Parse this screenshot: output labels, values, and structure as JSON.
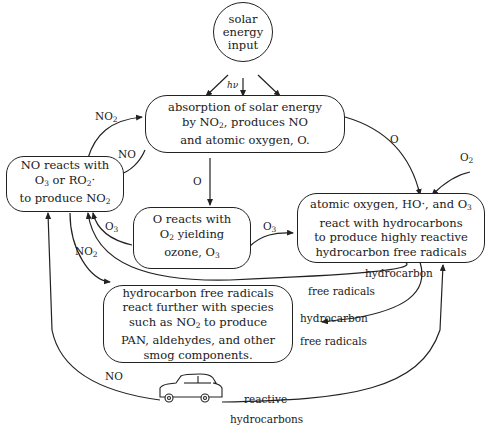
{
  "diagram": {
    "type": "photochemical-smog-cycle",
    "nodes": {
      "solar": {
        "line1": "solar",
        "line2": "energy",
        "line3": "input"
      },
      "absorption": {
        "line1": "absorption of solar energy",
        "line2a": "by NO",
        "line2sub": "2",
        "line2b": ", produces NO",
        "line3": "and atomic oxygen, O."
      },
      "no_reacts": {
        "line1": "NO reacts with",
        "line2a": "O",
        "line2sub": "3",
        "line2b": " or RO",
        "line2sub2": "2",
        "line2c": "·",
        "line3a": "to produce  NO",
        "line3sub": "2"
      },
      "o_reacts": {
        "line1": "O reacts with",
        "line2a": "O",
        "line2sub": "2",
        "line2b": " yielding",
        "line3a": "ozone, O",
        "line3sub": "3"
      },
      "atomic": {
        "line1a": "atomic oxygen, HO·, and O",
        "line1sub": "3",
        "line2": "react with hydrocarbons",
        "line3": "to produce highly reactive",
        "line4": "hydrocarbon free radicals"
      },
      "hc_radicals": {
        "line1": "hydrocarbon free radicals",
        "line2": "react further with species",
        "line3a": "such as NO",
        "line3sub": "2",
        "line3b": " to produce",
        "line4": "PAN, aldehydes, and other",
        "line5": "smog components."
      }
    },
    "edge_labels": {
      "hv": "hν",
      "no2_top": {
        "main": "NO",
        "sub": "2"
      },
      "no_mid": "NO",
      "o_mid": "O",
      "o_right": "O",
      "o2_right": {
        "main": "O",
        "sub": "2"
      },
      "o3_left": {
        "main": "O",
        "sub": "3"
      },
      "o3_right": {
        "main": "O",
        "sub": "3"
      },
      "no2_left": {
        "main": "NO",
        "sub": "2"
      },
      "hc_free_1a": "hydrocarbon",
      "hc_free_1b": "free radicals",
      "hc_free_2a": "hydrocarbon",
      "hc_free_2b": "free radicals",
      "no_bottom": "NO",
      "reactive_a": "reactive",
      "reactive_b": "hydrocarbons"
    },
    "icons": {
      "car": "automobile-icon"
    }
  }
}
